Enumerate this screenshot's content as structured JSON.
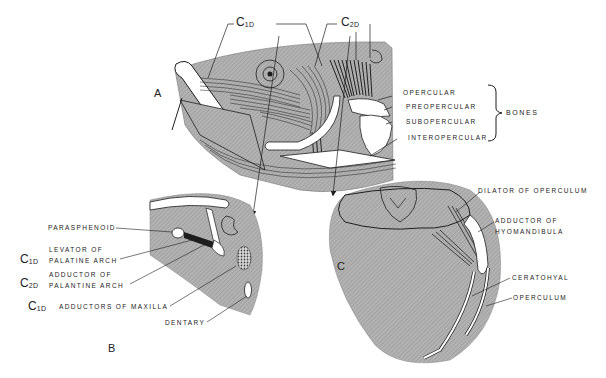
{
  "figure": {
    "panels": {
      "A": "A",
      "B": "B",
      "C": "C"
    },
    "top_codes": {
      "c1": {
        "main": "C",
        "sub": "1D"
      },
      "c2": {
        "main": "C",
        "sub": "2D"
      }
    },
    "panel_a_labels": {
      "opercular": "OPERCULAR",
      "preopercular": "PREOPERCULAR",
      "subopercular": "SUBOPERCULAR",
      "interopercular": "INTEROPERCULAR",
      "group": "BONES"
    },
    "panel_b_labels": {
      "parasphenoid": "PARASPHENOID",
      "levator_1": "LEVATOR OF",
      "levator_2": "PALATINE ARCH",
      "levator_code": {
        "main": "C",
        "sub": "1D"
      },
      "adductor_1": "ADDUCTOR OF",
      "adductor_2": "PALANTINE ARCH",
      "adductor_code": {
        "main": "C",
        "sub": "2D"
      },
      "maxilla": "ADDUCTORS OF MAXILLA",
      "maxilla_code": {
        "main": "C",
        "sub": "1D"
      },
      "dentary": "DENTARY"
    },
    "panel_c_labels": {
      "dilator": "DILATOR OF OPERCULUM",
      "adductor_1": "ADDUCTOR OF",
      "adductor_2": "HYOMANDIBULA",
      "ceratohyal": "CERATOHYAL",
      "operculum": "OPERCULUM"
    },
    "colors": {
      "shade": "#a9a9a9",
      "shade_light": "#bdbdbd",
      "ink": "#1e1e1e",
      "paper": "#ffffff"
    }
  }
}
